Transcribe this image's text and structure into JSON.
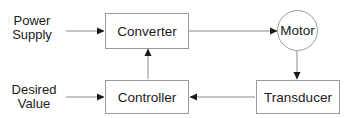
{
  "inputs": {
    "power_supply": "Power\nSupply",
    "power_supply_line1": "Power",
    "power_supply_line2": "Supply",
    "desired_value_line1": "Desired",
    "desired_value_line2": "Value"
  },
  "blocks": {
    "converter": "Converter",
    "controller": "Controller",
    "motor": "Motor",
    "transducer": "Transducer"
  },
  "colors": {
    "line": "#8a8a8a",
    "arrowhead": "#1a1a1a",
    "text": "#1a1a1a"
  }
}
